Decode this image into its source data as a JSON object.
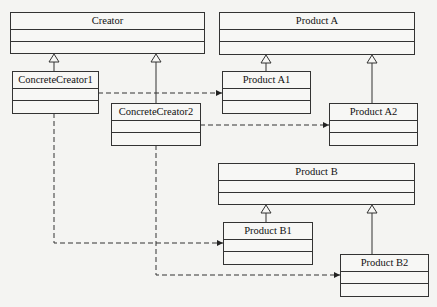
{
  "diagram": {
    "type": "UML class diagram (Factory Method)",
    "classes": {
      "creator": {
        "name": "Creator"
      },
      "concrete_creator1": {
        "name": "ConcreteCreator1"
      },
      "concrete_creator2": {
        "name": "ConcreteCreator2"
      },
      "product_a": {
        "name": "Product A"
      },
      "product_a1": {
        "name": "Product A1"
      },
      "product_a2": {
        "name": "Product A2"
      },
      "product_b": {
        "name": "Product B"
      },
      "product_b1": {
        "name": "Product B1"
      },
      "product_b2": {
        "name": "Product B2"
      }
    },
    "relations": [
      {
        "from": "ConcreteCreator1",
        "to": "Creator",
        "type": "generalization"
      },
      {
        "from": "ConcreteCreator2",
        "to": "Creator",
        "type": "generalization"
      },
      {
        "from": "Product A1",
        "to": "Product A",
        "type": "generalization"
      },
      {
        "from": "Product A2",
        "to": "Product A",
        "type": "generalization"
      },
      {
        "from": "Product B1",
        "to": "Product B",
        "type": "generalization"
      },
      {
        "from": "Product B2",
        "to": "Product B",
        "type": "generalization"
      },
      {
        "from": "ConcreteCreator1",
        "to": "Product A1",
        "type": "dependency"
      },
      {
        "from": "ConcreteCreator1",
        "to": "Product B1",
        "type": "dependency"
      },
      {
        "from": "ConcreteCreator2",
        "to": "Product A2",
        "type": "dependency"
      },
      {
        "from": "ConcreteCreator2",
        "to": "Product B2",
        "type": "dependency"
      }
    ]
  },
  "colors": {
    "line": "#333333",
    "background": "#f4f4f2"
  }
}
